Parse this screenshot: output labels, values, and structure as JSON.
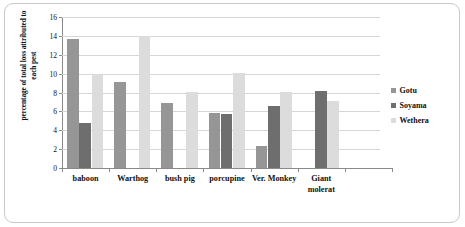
{
  "chart_data": {
    "type": "bar",
    "title": "",
    "xlabel": "",
    "ylabel": "percentage of total loss attributed to each pest",
    "ylim": [
      0,
      16
    ],
    "ytick_step": 2,
    "yticks": [
      0,
      2,
      4,
      6,
      8,
      10,
      12,
      14,
      16
    ],
    "grid": true,
    "legend_position": "right",
    "categories": [
      "baboon",
      "Warthog",
      "bush pig",
      "porcupine",
      "Ver. Monkey",
      "Giant molerat"
    ],
    "series": [
      {
        "name": "Gotu",
        "color": "#969696",
        "values": [
          13.7,
          9.1,
          6.9,
          5.8,
          2.3,
          null
        ]
      },
      {
        "name": "Soyama",
        "color": "#6e6e6e",
        "values": [
          4.8,
          null,
          null,
          5.7,
          6.6,
          8.2
        ]
      },
      {
        "name": "Wethera",
        "color": "#dcdcdc",
        "values": [
          10.0,
          14.0,
          8.1,
          10.1,
          8.1,
          7.1
        ]
      }
    ]
  },
  "legend": {
    "items": [
      {
        "label": "Gotu",
        "color": "#969696"
      },
      {
        "label": "Soyama",
        "color": "#6e6e6e"
      },
      {
        "label": "Wethera",
        "color": "#dcdcdc"
      }
    ]
  },
  "axes": {
    "y_title_line1": "percentage of total loss attributed to",
    "y_title_line2": "each pest"
  }
}
